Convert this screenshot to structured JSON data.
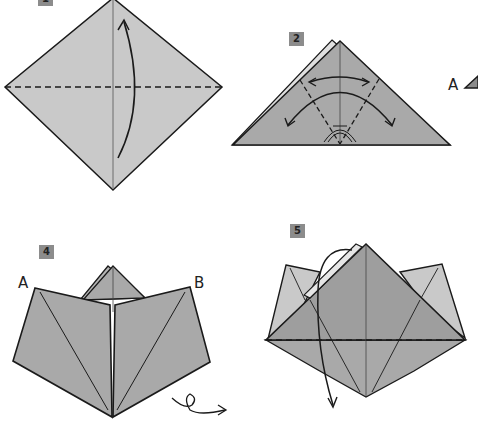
{
  "steps": [
    {
      "number": "1",
      "label": "1"
    },
    {
      "number": "2",
      "label": "2"
    },
    {
      "number": "4",
      "label": "4"
    },
    {
      "number": "5",
      "label": "5"
    }
  ],
  "labels": {
    "step2_side": "A",
    "step4_left": "A",
    "step4_right": "B"
  },
  "colors": {
    "paper_light": "#c9c9c9",
    "paper_mid": "#a9a9a9",
    "paper_dark": "#9e9e9e",
    "line": "#1a1a1a",
    "badge": "#8c8c8c"
  }
}
